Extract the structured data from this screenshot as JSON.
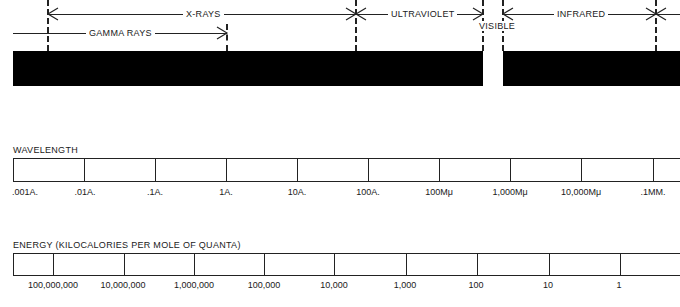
{
  "spectrum": {
    "bands": [
      {
        "name": "x-rays",
        "label": "X-RAYS"
      },
      {
        "name": "gamma-rays",
        "label": "GAMMA RAYS"
      },
      {
        "name": "ultraviolet",
        "label": "ULTRAVIOLET"
      },
      {
        "name": "visible",
        "label": "VISIBLE"
      },
      {
        "name": "infrared",
        "label": "INFRARED"
      }
    ]
  },
  "wavelength": {
    "title": "WAVELENGTH",
    "ticks": [
      ".001A.",
      ".01A.",
      ".1A.",
      "1A.",
      "10A.",
      "100A.",
      "100Mμ",
      "1,000Mμ",
      "10,000Mμ",
      ".1MM."
    ]
  },
  "energy": {
    "title": "ENERGY (KILOCALORIES PER MOLE OF QUANTA)",
    "ticks": [
      "100,000,000",
      "10,000,000",
      "1,000,000",
      "100,000",
      "10,000",
      "1,000",
      "100",
      "10",
      "1"
    ]
  },
  "colors": {
    "ink": "#1a1a1a",
    "bar": "#000000",
    "background": "#ffffff"
  }
}
